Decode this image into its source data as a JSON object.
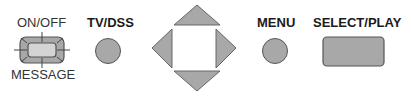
{
  "buttons": {
    "onoff": {
      "top_label": "ON/OFF",
      "bottom_label": "MESSAGE"
    },
    "tvdss": {
      "label": "TV/DSS"
    },
    "dpad": {
      "directions": [
        "up",
        "down",
        "left",
        "right"
      ]
    },
    "menu": {
      "label": "MENU"
    },
    "select": {
      "label": "SELECT/PLAY"
    }
  },
  "colors": {
    "button_fill": "#a8a8a8",
    "outline": "#555555",
    "inner_fill": "#cfcfcf"
  }
}
